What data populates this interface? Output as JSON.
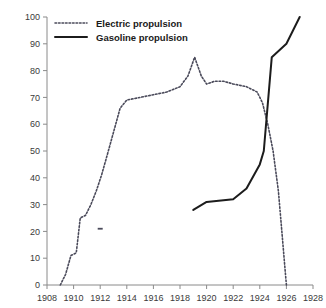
{
  "chart_data": {
    "type": "line",
    "title": "",
    "subtitle": "",
    "xlabel": "",
    "ylabel": "",
    "xlim": [
      1908,
      1928
    ],
    "ylim": [
      0,
      100
    ],
    "grid": false,
    "legend_position": "top-left",
    "x_ticks": [
      "1908",
      "1910",
      "1912",
      "1914",
      "1916",
      "1918",
      "1920",
      "1922",
      "1924",
      "1926",
      "1928"
    ],
    "y_ticks": [
      "0",
      "10",
      "20",
      "30",
      "40",
      "50",
      "60",
      "70",
      "80",
      "90",
      "100"
    ],
    "series": [
      {
        "name": "Electric propulsion",
        "style": "dotted",
        "color": "#4a4a5a",
        "x": [
          1909.0,
          1909.4,
          1909.8,
          1910.2,
          1910.5,
          1910.9,
          1911.3,
          1911.7,
          1912.1,
          1912.5,
          1913.0,
          1913.5,
          1914.0,
          1915.0,
          1916.0,
          1917.0,
          1918.0,
          1918.6,
          1919.1,
          1919.6,
          1920.0,
          1920.6,
          1921.3,
          1922.0,
          1923.0,
          1923.8,
          1924.2,
          1924.6,
          1925.0,
          1925.4,
          1926.0
        ],
        "y": [
          0,
          4,
          11,
          12,
          25,
          26,
          30,
          35,
          41,
          48,
          57,
          66,
          69,
          70,
          71,
          72,
          74,
          78,
          85,
          78,
          75,
          76,
          76,
          75,
          74,
          72,
          68,
          60,
          50,
          35,
          0
        ]
      },
      {
        "name": "Gasoline propulsion",
        "style": "solid",
        "color": "#1c1c1c",
        "x": [
          1919.0,
          1920.0,
          1922.0,
          1923.0,
          1924.0,
          1924.3,
          1924.9,
          1926.0,
          1927.0
        ],
        "y": [
          28,
          31,
          32,
          36,
          45,
          50,
          85,
          90,
          100
        ]
      }
    ],
    "annotations": [
      {
        "name": "stray-dash",
        "x": 1912.0,
        "y": 21
      }
    ]
  },
  "legend": {
    "items": [
      {
        "label": "Electric propulsion",
        "style": "dotted"
      },
      {
        "label": "Gasoline propulsion",
        "style": "solid"
      }
    ]
  },
  "colors": {
    "electric": "#4a4a5a",
    "gasoline": "#1c1c1c",
    "axis": "#8a8a8a",
    "background": "#ffffff",
    "tick_text": "#3a3a3a"
  }
}
